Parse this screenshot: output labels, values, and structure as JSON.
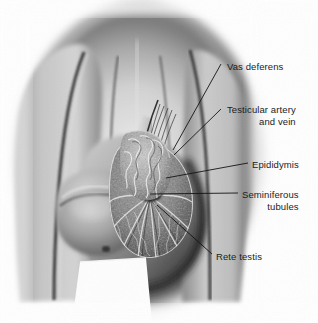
{
  "figure": {
    "style": "grayscale medical illustration",
    "background_color": "#fefefe",
    "label_color": "#1c1c1c",
    "leader_line_color": "#111111",
    "width": 318,
    "height": 323
  },
  "labels": {
    "vas_deferens": "Vas deferens",
    "testicular_artery_line1": "Testicular artery",
    "testicular_artery_line2": "and vein",
    "epididymis": "Epididymis",
    "seminiferous_line1": "Seminiferous",
    "seminiferous_line2": "tubules",
    "rete_testis": "Rete testis"
  }
}
